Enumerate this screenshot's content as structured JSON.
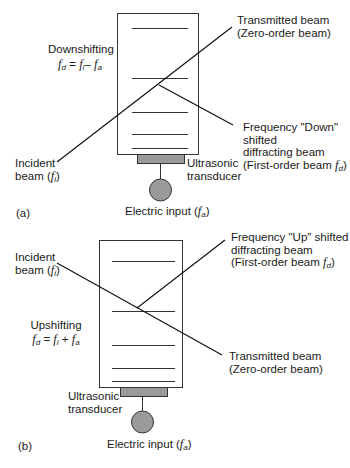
{
  "panel_a": {
    "tag": "(a)",
    "mode_title": "Downshifting",
    "equation": {
      "lhs": "f",
      "lhs_sub": "d",
      "eq": "=",
      "t1": "f",
      "t1_sub": "i",
      "op": "–",
      "t2": "f",
      "t2_sub": "a"
    },
    "incident": {
      "line1": "Incident",
      "line2_prefix": "beam (",
      "var": "f",
      "sub": "i",
      "line2_suffix": ")"
    },
    "transmitted": {
      "line1": "Transmitted beam",
      "line2": "(Zero-order beam)"
    },
    "diffracted": {
      "line1": "Frequency \"Down\"",
      "line2": "shifted",
      "line3": "diffracting beam",
      "line4_prefix": "(First-order beam ",
      "var": "f",
      "sub": "d",
      "line4_suffix": ")"
    },
    "transducer": {
      "line1": "Ultrasonic",
      "line2": "transducer"
    },
    "electric": {
      "prefix": "Electric input (",
      "var": "f",
      "sub": "a",
      "suffix": ")"
    }
  },
  "panel_b": {
    "tag": "(b)",
    "mode_title": "Upshifting",
    "equation": {
      "lhs": "f",
      "lhs_sub": "d",
      "eq": "=",
      "t1": "f",
      "t1_sub": "i",
      "op": "+",
      "t2": "f",
      "t2_sub": "a"
    },
    "incident": {
      "line1": "Incident",
      "line2_prefix": "beam (",
      "var": "f",
      "sub": "i",
      "line2_suffix": ")"
    },
    "transmitted": {
      "line1": "Transmitted beam",
      "line2": "(Zero-order beam)"
    },
    "diffracted": {
      "line1": "Frequency \"Up\" shifted",
      "line2": "diffracting beam",
      "line3_prefix": "(First-order beam ",
      "var": "f",
      "sub": "d",
      "line3_suffix": ")"
    },
    "transducer": {
      "line1": "Ultrasonic",
      "line2": "transducer"
    },
    "electric": {
      "prefix": "Electric input (",
      "var": "f",
      "sub": "a",
      "suffix": ")"
    }
  },
  "colors": {
    "line": "#1a1a1a",
    "transducer_fill": "#9a9a9a",
    "circle_fill": "#9a9a9a"
  }
}
